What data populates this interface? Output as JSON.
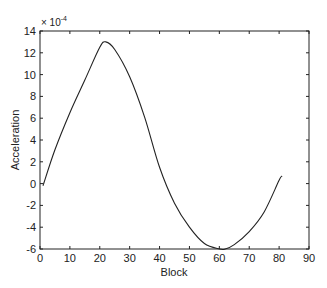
{
  "chart_data": {
    "type": "line",
    "title": "",
    "xlabel": "Block",
    "ylabel": "Acceleration",
    "y_multiplier_label": "× 10",
    "y_multiplier_exponent": "-4",
    "xlim": [
      0,
      90
    ],
    "ylim": [
      -6,
      14
    ],
    "xticks": [
      0,
      10,
      20,
      30,
      40,
      50,
      60,
      70,
      80,
      90
    ],
    "yticks": [
      -6,
      -4,
      -2,
      0,
      2,
      4,
      6,
      8,
      10,
      12,
      14
    ],
    "grid": false,
    "series": [
      {
        "name": "acceleration",
        "color": "#222222",
        "x": [
          1,
          5,
          10,
          15,
          20,
          22,
          25,
          30,
          35,
          40,
          45,
          50,
          55,
          60,
          62,
          65,
          70,
          75,
          80,
          81
        ],
        "y": [
          -0.2,
          3.1,
          6.5,
          9.5,
          12.5,
          13.0,
          12.3,
          9.8,
          6.1,
          1.5,
          -1.8,
          -4.0,
          -5.5,
          -6.0,
          -6.0,
          -5.6,
          -4.4,
          -2.6,
          0.3,
          0.7
        ]
      }
    ]
  }
}
